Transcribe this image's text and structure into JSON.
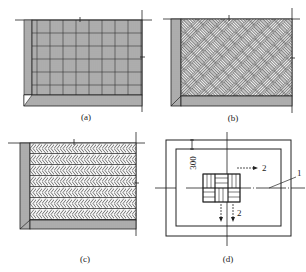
{
  "figure": {
    "panels": [
      {
        "id": "a",
        "caption": "(a)",
        "pattern": "basket-weave-square"
      },
      {
        "id": "b",
        "caption": "(b)",
        "pattern": "diagonal-basket-weave"
      },
      {
        "id": "c",
        "caption": "(c)",
        "pattern": "herringbone-rows"
      },
      {
        "id": "d",
        "caption": "(d)",
        "pattern": "layout-plan"
      }
    ],
    "panel_d": {
      "dimension_label": "300",
      "arrow_right_label": "2",
      "arrow_down_label": "2",
      "leader_label": "1"
    }
  },
  "colors": {
    "line": "#222222",
    "hatch": "#555555",
    "fill_shade": "#bdbdbd"
  }
}
